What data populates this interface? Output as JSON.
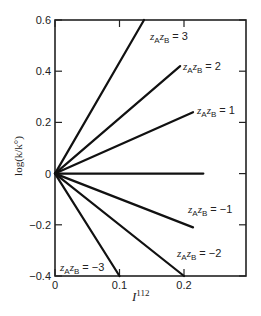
{
  "chart_data": {
    "type": "line",
    "title": "",
    "xlabel": "I^1/2",
    "xlabel_display": "I",
    "xlabel_sup": "112",
    "ylabel": "log(k/k°)",
    "xlim": [
      0,
      0.29
    ],
    "ylim": [
      -0.4,
      0.6
    ],
    "x_ticks": [
      "0",
      "0.1",
      "0.2"
    ],
    "y_ticks": [
      "0.6",
      "0.4",
      "0.2",
      "0",
      "−0.2",
      "−0.4"
    ],
    "grid": false,
    "legend": "inline labels",
    "series": [
      {
        "name": "zAzB = 3",
        "zAzB": 3,
        "x": [
          0,
          0.138
        ],
        "y": [
          0,
          0.6
        ],
        "label_value": "3"
      },
      {
        "name": "zAzB = 2",
        "zAzB": 2,
        "x": [
          0,
          0.194
        ],
        "y": [
          0,
          0.42
        ],
        "label_value": "2"
      },
      {
        "name": "zAzB = 1",
        "zAzB": 1,
        "x": [
          0,
          0.214
        ],
        "y": [
          0,
          0.24
        ],
        "label_value": "1"
      },
      {
        "name": "zAzB = 0",
        "zAzB": 0,
        "x": [
          0,
          0.23
        ],
        "y": [
          0,
          0
        ],
        "label_value": ""
      },
      {
        "name": "zAzB = −1",
        "zAzB": -1,
        "x": [
          0,
          0.214
        ],
        "y": [
          0,
          -0.21
        ],
        "label_value": "−1"
      },
      {
        "name": "zAzB = −2",
        "zAzB": -2,
        "x": [
          0,
          0.2
        ],
        "y": [
          0,
          -0.4
        ],
        "label_value": "−2"
      },
      {
        "name": "zAzB = −3",
        "zAzB": -3,
        "x": [
          0,
          0.1
        ],
        "y": [
          0,
          -0.4
        ],
        "label_value": "−3"
      }
    ]
  },
  "labels": {
    "z": "z",
    "subA": "A",
    "subB": "B",
    "eq": " = "
  }
}
